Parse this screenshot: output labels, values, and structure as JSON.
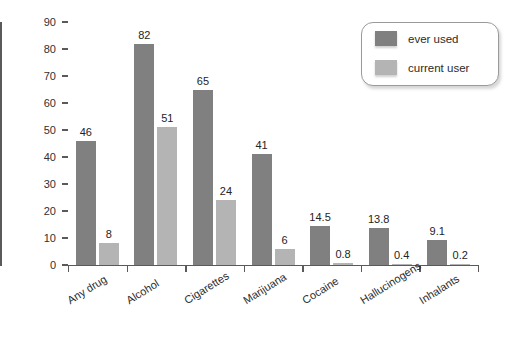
{
  "chart_data": {
    "type": "bar",
    "title": "",
    "xlabel": "",
    "ylabel": "Percentage",
    "ylim": [
      0,
      90
    ],
    "yticks": [
      0,
      10,
      20,
      30,
      40,
      50,
      60,
      70,
      80,
      90
    ],
    "grid": false,
    "legend_position": "top-right",
    "categories": [
      "Any drug",
      "Alcohol",
      "Cigarettes",
      "Marijuana",
      "Cocaine",
      "Hallucinogens",
      "Inhalants"
    ],
    "series": [
      {
        "name": "ever used",
        "color": "#808080",
        "values": [
          46,
          82,
          65,
          41,
          14.5,
          13.8,
          9.1
        ],
        "labels": [
          "46",
          "82",
          "65",
          "41",
          "14.5",
          "13.8",
          "9.1"
        ]
      },
      {
        "name": "current user",
        "color": "#b4b4b4",
        "values": [
          8,
          51,
          24,
          6,
          0.8,
          0.4,
          0.2
        ],
        "labels": [
          "8",
          "51",
          "24",
          "6",
          "0.8",
          "0.4",
          "0.2"
        ]
      }
    ]
  },
  "axis": {
    "y_title": "Percentage",
    "y_tick_labels": [
      "0",
      "10",
      "20",
      "30",
      "40",
      "50",
      "60",
      "70",
      "80",
      "90"
    ]
  },
  "legend": {
    "entries": [
      {
        "label": "ever used",
        "swatch": "ever"
      },
      {
        "label": "current user",
        "swatch": "current"
      }
    ]
  }
}
